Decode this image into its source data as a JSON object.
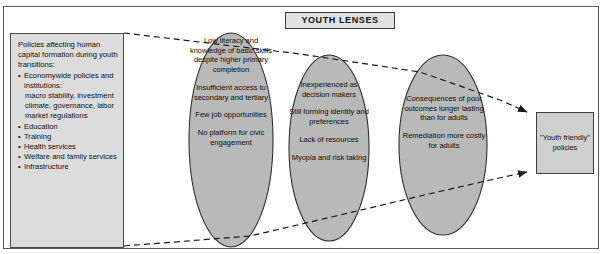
{
  "figure": {
    "clipped_top_text": "·   ·   ·   ·   ·   ·   ·   ·   ·"
  },
  "header": {
    "label": "YOUTH LENSES"
  },
  "policy_box": {
    "intro": "Policies affecting human capital formation during youth transitions:",
    "items": [
      {
        "label": "Economywide policies and institutions:",
        "detail": "macro stability, investment climate, governance, labor market regulations"
      },
      {
        "label": "Education",
        "detail": ""
      },
      {
        "label": "Training",
        "detail": ""
      },
      {
        "label": "Health services",
        "detail": ""
      },
      {
        "label": "Welfare and family services",
        "detail": ""
      },
      {
        "label": "Infrastructure",
        "detail": ""
      }
    ]
  },
  "lenses": [
    {
      "name": "lens-one",
      "blocks": [
        "Low literacy and knowledge of basic skills despite higher primary completion",
        "Insufficient access to secondary and tertiary",
        "Few job opportunities",
        "No platform for civic engagement"
      ]
    },
    {
      "name": "lens-two",
      "blocks": [
        "Inexperienced as decision makers",
        "Still forming identity and preferences",
        "Lack of resources",
        "Myopia and risk taking"
      ]
    },
    {
      "name": "lens-three",
      "blocks": [
        "Consequences of poor outcomes longer lasting than for adults",
        "Remediation more costly for adults"
      ]
    }
  ],
  "outcome_box": {
    "text": "\"Youth friendly\" policies"
  },
  "colors": {
    "lens_fill": "#b9b9b9",
    "policy_box_fill": "#dcdcdc",
    "outcome_box_fill": "#cfcfcf",
    "header_fill": "#e2e2e2",
    "stroke": "#3d3d3d",
    "frame": "#5a5a5a"
  }
}
